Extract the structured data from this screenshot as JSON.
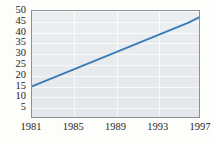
{
  "figure": {
    "partial_label": ")",
    "plot_background": "#e7ebee",
    "grid_color": "#fbfcfc",
    "frame_color": "#8e9094",
    "line_color": "#3b7cb8",
    "text_color": "#242424"
  },
  "chart_data": {
    "type": "line",
    "title": "",
    "subtitle": "",
    "xlabel": "",
    "ylabel": "",
    "xlim": [
      1981,
      1997
    ],
    "ylim": [
      0,
      50
    ],
    "grid": true,
    "legend": null,
    "x_tick_labels": [
      "1981",
      "1985",
      "1989",
      "1993",
      "1997"
    ],
    "x_ticks": [
      1981,
      1985,
      1989,
      1993,
      1997
    ],
    "y_tick_labels": [
      "50",
      "45",
      "40",
      "35",
      "30",
      "25",
      "20",
      "15",
      "10",
      "5"
    ],
    "y_ticks": [
      50,
      45,
      40,
      35,
      30,
      25,
      20,
      15,
      10,
      5
    ],
    "series": [
      {
        "name": "trend",
        "color": "#3b7cb8",
        "x": [
          1981,
          1982,
          1983,
          1984,
          1985,
          1986,
          1987,
          1988,
          1989,
          1990,
          1991,
          1992,
          1993,
          1994,
          1995,
          1996,
          1997
        ],
        "values": [
          14.5,
          16.5,
          18.5,
          20.5,
          22.5,
          24.5,
          26.5,
          28.5,
          30.5,
          32.5,
          34.5,
          36.5,
          38.5,
          40.5,
          42.5,
          44.5,
          47.0
        ]
      }
    ]
  }
}
